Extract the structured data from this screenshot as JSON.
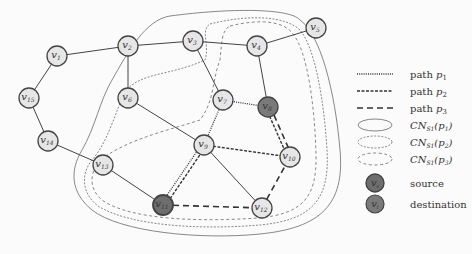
{
  "nodes": [
    {
      "id": "v1",
      "label": "v1",
      "x": 57,
      "y": 56,
      "type": "normal"
    },
    {
      "id": "v2",
      "label": "v2",
      "x": 128,
      "y": 46,
      "type": "normal"
    },
    {
      "id": "v3",
      "label": "v3",
      "x": 193,
      "y": 41,
      "type": "normal"
    },
    {
      "id": "v4",
      "label": "v4",
      "x": 257,
      "y": 46,
      "type": "normal"
    },
    {
      "id": "v5",
      "label": "v5",
      "x": 316,
      "y": 28,
      "type": "normal"
    },
    {
      "id": "v6",
      "label": "v6",
      "x": 128,
      "y": 98,
      "type": "normal"
    },
    {
      "id": "v7",
      "label": "v7",
      "x": 223,
      "y": 100,
      "type": "normal"
    },
    {
      "id": "v8",
      "label": "v8",
      "x": 268,
      "y": 107,
      "type": "destination"
    },
    {
      "id": "v9",
      "label": "v9",
      "x": 204,
      "y": 145,
      "type": "normal"
    },
    {
      "id": "v10",
      "label": "v10",
      "x": 290,
      "y": 157,
      "type": "normal"
    },
    {
      "id": "v11",
      "label": "v11",
      "x": 163,
      "y": 205,
      "type": "source"
    },
    {
      "id": "v12",
      "label": "v12",
      "x": 262,
      "y": 208,
      "type": "normal"
    },
    {
      "id": "v13",
      "label": "v13",
      "x": 103,
      "y": 165,
      "type": "normal"
    },
    {
      "id": "v14",
      "label": "v14",
      "x": 48,
      "y": 141,
      "type": "normal"
    },
    {
      "id": "v15",
      "label": "v15",
      "x": 29,
      "y": 98,
      "type": "normal"
    }
  ],
  "edges": [
    [
      "v1",
      "v2"
    ],
    [
      "v2",
      "v3"
    ],
    [
      "v3",
      "v4"
    ],
    [
      "v4",
      "v5"
    ],
    [
      "v1",
      "v15"
    ],
    [
      "v15",
      "v14"
    ],
    [
      "v14",
      "v13"
    ],
    [
      "v13",
      "v11"
    ],
    [
      "v2",
      "v6"
    ],
    [
      "v6",
      "v9"
    ],
    [
      "v3",
      "v7"
    ],
    [
      "v4",
      "v8"
    ],
    [
      "v9",
      "v12"
    ]
  ],
  "paths": {
    "p1": [
      "v11",
      "v9",
      "v7",
      "v8"
    ],
    "p2": [
      "v11",
      "v9",
      "v10",
      "v8"
    ],
    "p3": [
      "v11",
      "v12",
      "v10",
      "v8"
    ]
  },
  "legend": {
    "items": [
      {
        "label": "path p1",
        "style": "dotted-line"
      },
      {
        "label": "path p2",
        "style": "dashed-line"
      },
      {
        "label": "path p3",
        "style": "long-dashed-line"
      },
      {
        "label": "CN_S1(p1)",
        "style": "solid-ellipse"
      },
      {
        "label": "CN_S1(p2)",
        "style": "dense-dashed-ellipse"
      },
      {
        "label": "CN_S1(p3)",
        "style": "dashed-ellipse"
      },
      {
        "label": "source",
        "style": "source-node",
        "node_label": "vs"
      },
      {
        "label": "destination",
        "style": "destination-node",
        "node_label": "vt"
      }
    ]
  },
  "colors": {
    "node_fill": "#e6e6e6",
    "source_fill": "#6e6e6e",
    "destination_fill": "#7a7a7a",
    "edge": "#444444",
    "region": "#777777"
  }
}
